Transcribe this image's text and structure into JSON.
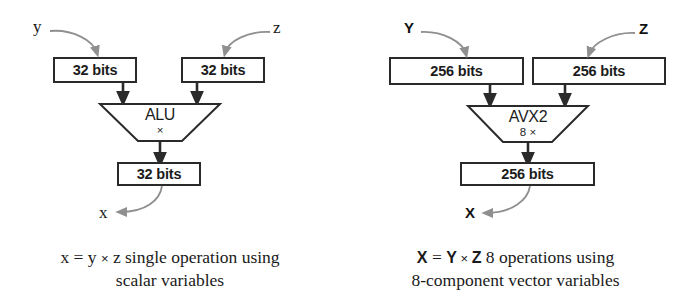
{
  "figure": {
    "background_color": "#ffffff",
    "line_color": "#2a2a2a",
    "curve_color": "#8a8a8a"
  },
  "panels": [
    {
      "id": "scalar",
      "input_left": {
        "label": "32 bits",
        "source_var": "y"
      },
      "input_right": {
        "label": "32 bits",
        "source_var": "z"
      },
      "unit": {
        "name": "ALU",
        "sub": "×"
      },
      "output": {
        "label": "32 bits",
        "result_var": "x"
      },
      "caption_line1_pre": "x = y ",
      "caption_line1_times": "×",
      "caption_line1_post": " z single operation using",
      "caption_line2": "scalar variables"
    },
    {
      "id": "vector",
      "input_left": {
        "label": "256 bits",
        "source_var": "Y"
      },
      "input_right": {
        "label": "256 bits",
        "source_var": "Z"
      },
      "unit": {
        "name": "AVX2",
        "sub": "8 ×"
      },
      "output": {
        "label": "256 bits",
        "result_var": "X"
      },
      "caption_line1_pre_bold_a": "X",
      "caption_line1_eq": " = ",
      "caption_line1_pre_bold_b": "Y",
      "caption_line1_times": " × ",
      "caption_line1_pre_bold_c": "Z",
      "caption_line1_post": "  8 operations using",
      "caption_line2": "8-component vector variables"
    }
  ]
}
